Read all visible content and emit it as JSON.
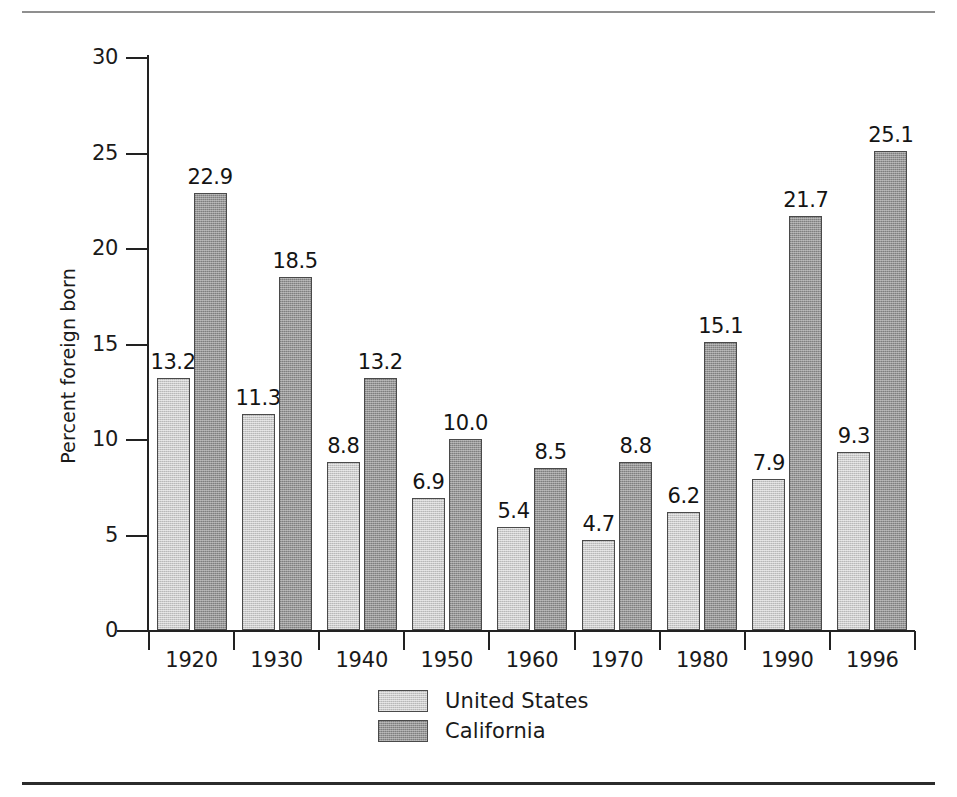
{
  "chart_data": {
    "type": "bar",
    "title": "",
    "xlabel": "",
    "ylabel": "Percent foreign born",
    "ylim": [
      0,
      30
    ],
    "ytick_values": [
      0,
      5,
      10,
      15,
      20,
      25,
      30
    ],
    "ytick_labels": [
      "0",
      "5",
      "10",
      "15",
      "20",
      "25",
      "30"
    ],
    "grid": false,
    "legend_position": "bottom-center",
    "categories": [
      "1920",
      "1930",
      "1940",
      "1950",
      "1960",
      "1970",
      "1980",
      "1990",
      "1996"
    ],
    "series": [
      {
        "name": "United States",
        "color": "#cbcbcb",
        "values": [
          13.2,
          11.3,
          8.8,
          6.9,
          5.4,
          4.7,
          6.2,
          7.9,
          9.3
        ],
        "labels": [
          "13.2",
          "11.3",
          "8.8",
          "6.9",
          "5.4",
          "4.7",
          "6.2",
          "7.9",
          "9.3"
        ]
      },
      {
        "name": "California",
        "color": "#979797",
        "values": [
          22.9,
          18.5,
          13.2,
          10.0,
          8.5,
          8.8,
          15.1,
          21.7,
          25.1
        ],
        "labels": [
          "22.9",
          "18.5",
          "13.2",
          "10.0",
          "8.5",
          "8.8",
          "15.1",
          "21.7",
          "25.1"
        ]
      }
    ]
  },
  "legend": {
    "entries": [
      {
        "label": "United States",
        "swatch": "us"
      },
      {
        "label": "California",
        "swatch": "ca"
      }
    ]
  }
}
